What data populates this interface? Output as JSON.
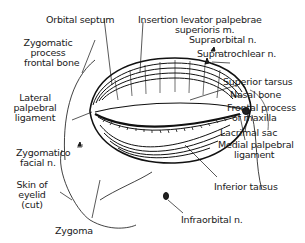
{
  "diagram": {
    "labels": {
      "orbital_septum": "Orbital septum",
      "insertion_levator_1": "Insertion levator palpebrae",
      "insertion_levator_2": "superioris m.",
      "supraorbital_n": "Supraorbital  n.",
      "supratrochlear_n": "Supratrochlear n.",
      "zygomatic_process_1": "Zygomatic",
      "zygomatic_process_2": "process",
      "zygomatic_process_3": "frontal bone",
      "superior_tarsus": "Superior tarsus",
      "nasal_bone": "Nasal bone",
      "frontal_process_1": "Frontal process",
      "frontal_process_2": "of maxilla",
      "lateral_palpebral_1": "Lateral",
      "lateral_palpebral_2": "palpebral",
      "lateral_palpebral_3": "ligament",
      "lacrimal_sac": "Lacrimal sac",
      "medial_palpebral_1": "Medial palpebral",
      "medial_palpebral_2": "ligament",
      "zygomaticofacial_1": "Zygomatico",
      "zygomaticofacial_2": "facial n.",
      "inferior_tarsus": "Inferior tarsus",
      "skin_eyelid_1": "Skin of",
      "skin_eyelid_2": "eyelid",
      "skin_eyelid_3": "(cut)",
      "zygoma": "Zygoma",
      "infraorbital_n": "Infraorbital  n."
    }
  }
}
